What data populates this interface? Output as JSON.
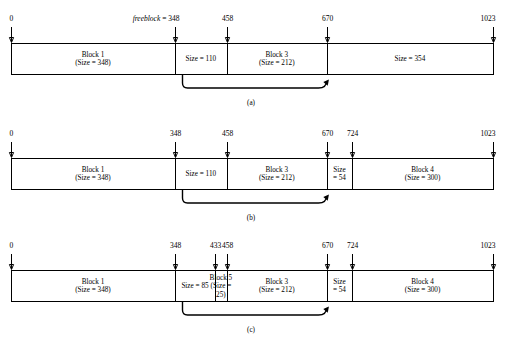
{
  "figure": {
    "type": "memory-allocation-diagram",
    "address_min": 0,
    "address_max": 1023,
    "font_color": "#000000",
    "background": "#ffffff",
    "line_color": "#000000"
  },
  "panels": [
    {
      "id": "a",
      "caption": "(a)",
      "ticks": [
        {
          "value": 0,
          "label": "0",
          "prefix": "",
          "address": 0
        },
        {
          "value": 348,
          "label": "348",
          "prefix": "freeblock = ",
          "address": 348
        },
        {
          "value": 458,
          "label": "458",
          "prefix": "",
          "address": 458
        },
        {
          "value": 670,
          "label": "670",
          "prefix": "",
          "address": 670
        },
        {
          "value": 1023,
          "label": "1023",
          "prefix": "",
          "address": 1023
        }
      ],
      "cells": [
        {
          "start": 0,
          "end": 348,
          "lines": [
            "Block 1",
            "(Size = 348)"
          ]
        },
        {
          "start": 348,
          "end": 458,
          "lines": [
            "Size = 110"
          ]
        },
        {
          "start": 458,
          "end": 670,
          "lines": [
            "Block 3",
            "(Size = 212)"
          ]
        },
        {
          "start": 670,
          "end": 1023,
          "lines": [
            "Size = 354"
          ]
        }
      ],
      "link_arrow": {
        "from": 348,
        "to": 670
      }
    },
    {
      "id": "b",
      "caption": "(b)",
      "ticks": [
        {
          "value": 0,
          "label": "0",
          "prefix": "",
          "address": 0
        },
        {
          "value": 348,
          "label": "348",
          "prefix": "",
          "address": 348
        },
        {
          "value": 458,
          "label": "458",
          "prefix": "",
          "address": 458
        },
        {
          "value": 670,
          "label": "670",
          "prefix": "",
          "address": 670
        },
        {
          "value": 724,
          "label": "724",
          "prefix": "",
          "address": 724
        },
        {
          "value": 1023,
          "label": "1023",
          "prefix": "",
          "address": 1023
        }
      ],
      "cells": [
        {
          "start": 0,
          "end": 348,
          "lines": [
            "Block 1",
            "(Size = 348)"
          ]
        },
        {
          "start": 348,
          "end": 458,
          "lines": [
            "Size = 110"
          ]
        },
        {
          "start": 458,
          "end": 670,
          "lines": [
            "Block 3",
            "(Size = 212)"
          ]
        },
        {
          "start": 670,
          "end": 724,
          "lines": [
            "Size",
            "= 54"
          ]
        },
        {
          "start": 724,
          "end": 1023,
          "lines": [
            "Block 4",
            "(Size = 300)"
          ]
        }
      ],
      "link_arrow": {
        "from": 348,
        "to": 670
      }
    },
    {
      "id": "c",
      "caption": "(c)",
      "ticks": [
        {
          "value": 0,
          "label": "0",
          "prefix": "",
          "address": 0
        },
        {
          "value": 348,
          "label": "348",
          "prefix": "",
          "address": 348
        },
        {
          "value": 433,
          "label": "433",
          "prefix": "",
          "address": 433
        },
        {
          "value": 458,
          "label": "458",
          "prefix": "",
          "address": 458
        },
        {
          "value": 670,
          "label": "670",
          "prefix": "",
          "address": 670
        },
        {
          "value": 724,
          "label": "724",
          "prefix": "",
          "address": 724
        },
        {
          "value": 1023,
          "label": "1023",
          "prefix": "",
          "address": 1023
        }
      ],
      "cells": [
        {
          "start": 0,
          "end": 348,
          "lines": [
            "Block 1",
            "(Size = 348)"
          ]
        },
        {
          "start": 348,
          "end": 433,
          "lines": [
            "Size = 85"
          ]
        },
        {
          "start": 433,
          "end": 458,
          "lines": [
            "Block 5",
            "(Size =",
            "25)"
          ]
        },
        {
          "start": 458,
          "end": 670,
          "lines": [
            "Block 3",
            "(Size = 212)"
          ]
        },
        {
          "start": 670,
          "end": 724,
          "lines": [
            "Size",
            "= 54"
          ]
        },
        {
          "start": 724,
          "end": 1023,
          "lines": [
            "Block 4",
            "(Size = 300)"
          ]
        }
      ],
      "link_arrow": {
        "from": 348,
        "to": 670
      }
    }
  ]
}
